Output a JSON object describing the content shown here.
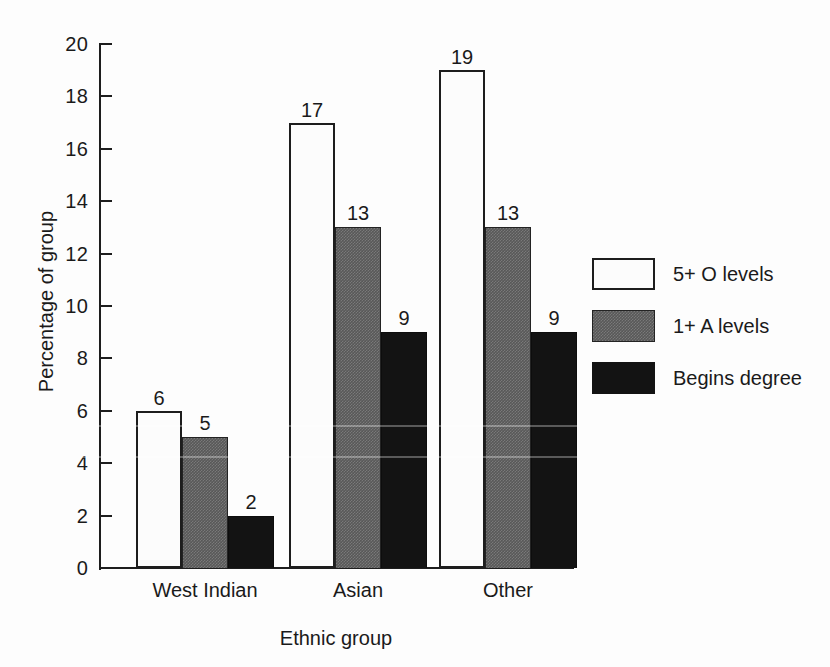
{
  "chart_data": {
    "type": "bar",
    "title": "",
    "xlabel": "Ethnic group",
    "ylabel": "Percentage of group",
    "categories": [
      "West Indian",
      "Asian",
      "Other"
    ],
    "series": [
      {
        "name": "5+ O levels",
        "values": [
          6,
          17,
          19
        ],
        "color": "#fcfcfc"
      },
      {
        "name": "1+ A levels",
        "values": [
          5,
          13,
          13
        ],
        "color": "#585858"
      },
      {
        "name": "Begins degree",
        "values": [
          2,
          9,
          9
        ],
        "color": "#131313"
      }
    ],
    "ylim": [
      0,
      20
    ],
    "ytick_step": 2,
    "yticks": [
      "0",
      "2",
      "4",
      "6",
      "8",
      "10",
      "12",
      "14",
      "16",
      "18",
      "20"
    ],
    "grid": false,
    "legend_position": "right",
    "data_labels": true
  },
  "legend": {
    "items": [
      {
        "label": "5+ O levels"
      },
      {
        "label": "1+ A levels"
      },
      {
        "label": "Begins degree"
      }
    ]
  }
}
